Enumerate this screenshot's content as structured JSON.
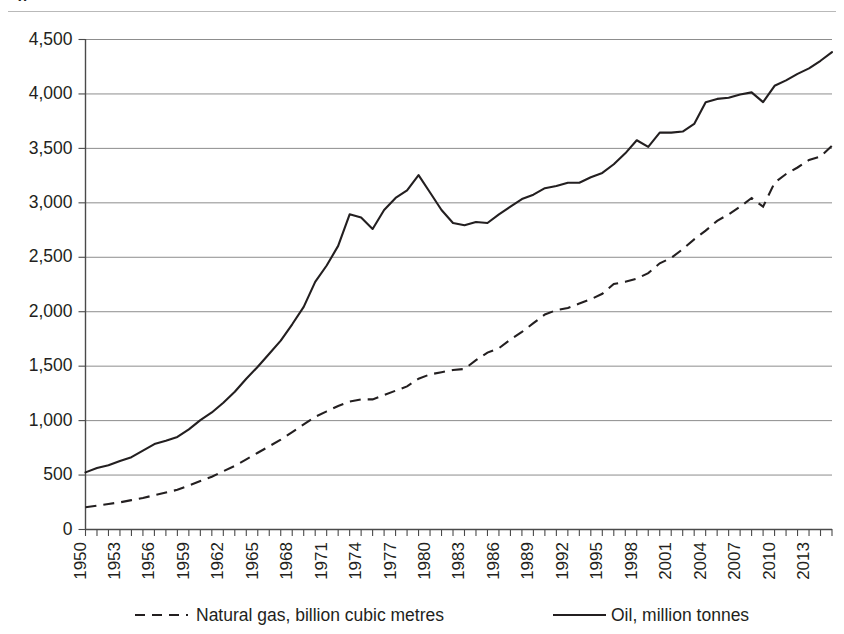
{
  "figure": {
    "title_fragment": "g",
    "background": "#ffffff",
    "ink_color": "#231f20",
    "grid_color": "#8d8d8d"
  },
  "legend": {
    "position": "bottom",
    "entries": [
      {
        "label": "Natural gas, billion cubic metres",
        "style": "dashed",
        "color": "#231f20"
      },
      {
        "label": "Oil, million tonnes",
        "style": "solid",
        "color": "#231f20"
      }
    ]
  },
  "axes": {
    "y_ticks": [
      "0",
      "500",
      "1,000",
      "1,500",
      "2,000",
      "2,500",
      "3,000",
      "3,500",
      "4,000",
      "4,500"
    ],
    "x_ticks": [
      "1950",
      "1953",
      "1956",
      "1959",
      "1962",
      "1965",
      "1968",
      "1971",
      "1974",
      "1977",
      "1980",
      "1983",
      "1986",
      "1989",
      "1992",
      "1995",
      "1998",
      "2001",
      "2004",
      "2007",
      "2010",
      "2013"
    ],
    "ylim": [
      0,
      4500
    ],
    "xlim": [
      1950,
      2015
    ],
    "grid": true
  },
  "chart_data": {
    "type": "line",
    "title": "",
    "subtitle": "",
    "xlabel": "",
    "ylabel": "",
    "ylim": [
      0,
      4500
    ],
    "xlim": [
      1950,
      2015
    ],
    "grid": true,
    "legend_position": "bottom",
    "x": [
      1950,
      1951,
      1952,
      1953,
      1954,
      1955,
      1956,
      1957,
      1958,
      1959,
      1960,
      1961,
      1962,
      1963,
      1964,
      1965,
      1966,
      1967,
      1968,
      1969,
      1970,
      1971,
      1972,
      1973,
      1974,
      1975,
      1976,
      1977,
      1978,
      1979,
      1980,
      1981,
      1982,
      1983,
      1984,
      1985,
      1986,
      1987,
      1988,
      1989,
      1990,
      1991,
      1992,
      1993,
      1994,
      1995,
      1996,
      1997,
      1998,
      1999,
      2000,
      2001,
      2002,
      2003,
      2004,
      2005,
      2006,
      2007,
      2008,
      2009,
      2010,
      2011,
      2012,
      2013,
      2014,
      2015
    ],
    "series": [
      {
        "name": "Oil, million tonnes",
        "style": "solid",
        "color": "#231f20",
        "unit": "million tonnes",
        "values": [
          520,
          560,
          585,
          625,
          660,
          720,
          780,
          810,
          845,
          915,
          1000,
          1070,
          1160,
          1260,
          1380,
          1490,
          1610,
          1730,
          1880,
          2040,
          2270,
          2420,
          2600,
          2890,
          2860,
          2755,
          2930,
          3040,
          3110,
          3250,
          3090,
          2930,
          2810,
          2790,
          2820,
          2810,
          2890,
          2960,
          3030,
          3070,
          3130,
          3150,
          3180,
          3180,
          3230,
          3270,
          3350,
          3450,
          3570,
          3510,
          3640,
          3640,
          3650,
          3720,
          3920,
          3950,
          3960,
          3990,
          4010,
          3920,
          4070,
          4120,
          4180,
          4230,
          4300,
          4380
        ]
      },
      {
        "name": "Natural gas, billion cubic metres",
        "style": "dashed",
        "color": "#231f20",
        "unit": "billion cubic metres",
        "values": [
          200,
          215,
          230,
          245,
          265,
          285,
          310,
          335,
          360,
          400,
          440,
          480,
          530,
          580,
          640,
          700,
          760,
          820,
          890,
          960,
          1030,
          1080,
          1130,
          1170,
          1190,
          1190,
          1230,
          1270,
          1310,
          1380,
          1420,
          1440,
          1460,
          1470,
          1550,
          1620,
          1660,
          1740,
          1810,
          1890,
          1970,
          2010,
          2030,
          2070,
          2110,
          2160,
          2250,
          2270,
          2300,
          2350,
          2440,
          2490,
          2570,
          2660,
          2740,
          2830,
          2890,
          2960,
          3040,
          2960,
          3180,
          3260,
          3320,
          3390,
          3420,
          3520
        ]
      }
    ]
  }
}
